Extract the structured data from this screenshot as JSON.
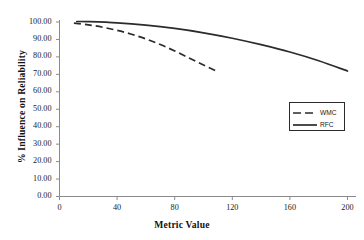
{
  "chart_data": {
    "type": "line",
    "title": "",
    "xlabel": "Metric Value",
    "ylabel": "% Influence on Reliability",
    "xlim": [
      0,
      200
    ],
    "ylim": [
      0,
      100
    ],
    "grid": false,
    "legend_position": "right-middle",
    "xticks": [
      "0",
      "40",
      "80",
      "120",
      "160",
      "200"
    ],
    "xtick_values": [
      0,
      40,
      80,
      120,
      160,
      200
    ],
    "yticks": [
      "0.00",
      "10.00",
      "20.00",
      "30.00",
      "40.00",
      "50.00",
      "60.00",
      "70.00",
      "80.00",
      "90.00",
      "100.00"
    ],
    "ytick_values": [
      0,
      10,
      20,
      30,
      40,
      50,
      60,
      70,
      80,
      90,
      100
    ],
    "series": [
      {
        "name": "WMC",
        "style": "dashed",
        "color": "#2b2b2b",
        "x": [
          10,
          20,
          30,
          40,
          50,
          60,
          70,
          80,
          90,
          100,
          110
        ],
        "values": [
          99.3,
          98.4,
          97.0,
          95.2,
          93.0,
          90.3,
          87.1,
          83.4,
          79.4,
          75.4,
          71.5
        ]
      },
      {
        "name": "RFC",
        "style": "solid",
        "color": "#2b2b2b",
        "x": [
          12,
          20,
          40,
          60,
          80,
          100,
          120,
          140,
          160,
          180,
          200
        ],
        "values": [
          100.3,
          100.2,
          99.5,
          98.2,
          96.3,
          93.8,
          90.7,
          87.0,
          82.8,
          77.8,
          71.9
        ]
      }
    ]
  },
  "legend": {
    "items": [
      {
        "label": "WMC",
        "style": "dashed"
      },
      {
        "label": "RFC",
        "style": "solid"
      }
    ]
  }
}
